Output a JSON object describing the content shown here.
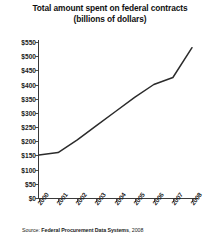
{
  "chart_data": {
    "type": "line",
    "title": "Total amount spent on federal contracts (billions of dollars)",
    "xlabel": "",
    "ylabel": "",
    "categories": [
      "2000",
      "2001",
      "2002",
      "2003",
      "2004",
      "2005",
      "2006",
      "2007",
      "2008"
    ],
    "x": [
      2000,
      2001,
      2002,
      2003,
      2004,
      2005,
      2006,
      2007,
      2008
    ],
    "values": [
      152,
      160,
      205,
      255,
      305,
      355,
      400,
      425,
      530
    ],
    "series": [
      {
        "name": "Total amount spent on federal contracts",
        "values": [
          152,
          160,
          205,
          255,
          305,
          355,
          400,
          425,
          530
        ]
      }
    ],
    "ylim": [
      0,
      550
    ],
    "ytick_values": [
      0,
      50,
      100,
      150,
      200,
      250,
      300,
      350,
      400,
      450,
      500,
      550
    ],
    "ytick_labels": [
      "$0",
      "$50",
      "$100",
      "$150",
      "$200",
      "$250",
      "$300",
      "$350",
      "$400",
      "$450",
      "$500",
      "$550"
    ],
    "xtick_labels": [
      "2000",
      "2001",
      "2002",
      "2003",
      "2004",
      "2005",
      "2006",
      "2007",
      "2008"
    ],
    "grid": false,
    "legend": false,
    "line_color": "#2b2b2b",
    "axis_color": "#3a3a3a"
  },
  "source": {
    "label": "Source:",
    "value": "Federal Procurement Data Systems",
    "tail": ", 2008"
  }
}
